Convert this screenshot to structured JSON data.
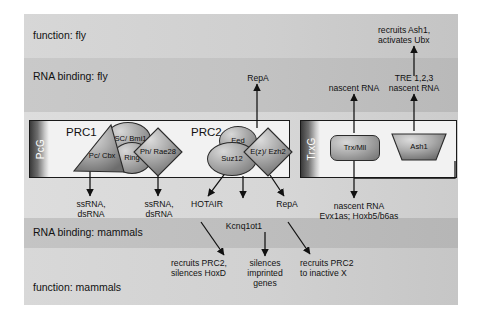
{
  "bands": {
    "function_fly": "function: fly",
    "rna_binding_fly": "RNA binding: fly",
    "rna_binding_mammals": "RNA binding: mammals",
    "function_mammals": "function: mammals"
  },
  "groups": {
    "pcg": {
      "strip_label": "PcG",
      "complexes": [
        {
          "name": "PRC1",
          "subunits": [
            {
              "label": "Pc/\nCbx",
              "shape": "triangle"
            },
            {
              "label": "PSC/\nBmi1",
              "shape": "ellipse"
            },
            {
              "label": "Ph/\nRae28",
              "shape": "diamond"
            },
            {
              "label": "Ring",
              "shape": "ellipse"
            }
          ]
        },
        {
          "name": "PRC2",
          "subunits": [
            {
              "label": "Eed",
              "shape": "ellipse"
            },
            {
              "label": "Suz12",
              "shape": "ellipse"
            },
            {
              "label": "E(z)/\nEzh2",
              "shape": "diamond"
            }
          ]
        }
      ]
    },
    "trxg": {
      "strip_label": "TrxG",
      "subunits": [
        {
          "label": "Trx/Mll",
          "shape": "rounded-rect"
        },
        {
          "label": "Ash1",
          "shape": "trapezoid"
        }
      ]
    }
  },
  "annotations": {
    "prc1_rna_left": "ssRNA,\ndsRNA",
    "prc1_rna_right": "ssRNA,\ndsRNA",
    "prc2_rna_hotair": "HOTAIR",
    "prc2_rna_kcnq": "Kcnq1ot1",
    "prc2_rna_repa_down": "RepA",
    "prc2_rna_repa_up": "RepA",
    "trx_nascent_rna": "nascent RNA",
    "ash1_tre": "TRE 1,2,3\nnascent RNA",
    "ash1_function": "recruits Ash1,\nactivates Ubx",
    "trx_mammal_rna": "nascent RNA\nEvx1as; Hoxb5/b6as",
    "hotair_function": "recruits PRC2,\nsilences HoxD",
    "kcnq_function": "silences\nimprinted\ngenes",
    "repa_function": "recruits PRC2\nto inactive X"
  },
  "colors": {
    "outline": "#1a1a1a",
    "shape_fill_light": "#d8d8d8",
    "shape_fill_dark": "#6e6e6e",
    "band_light": "#d8d8d8",
    "band_dark": "#b6b6b6",
    "strip_dark": "#3a3a3a"
  }
}
